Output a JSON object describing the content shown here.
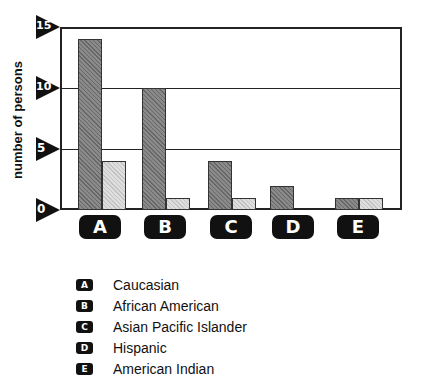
{
  "chart_data": {
    "type": "bar",
    "title": "",
    "xlabel": "",
    "ylabel": "number of persons",
    "ylim": [
      0,
      15
    ],
    "yticks": [
      0,
      5,
      10,
      15
    ],
    "grid": true,
    "categories": [
      "A",
      "B",
      "C",
      "D",
      "E"
    ],
    "category_legend": {
      "A": "Caucasian",
      "B": "African American",
      "C": "Asian Pacific Islander",
      "D": "Hispanic",
      "E": "American Indian"
    },
    "series": [
      {
        "name": "dark",
        "values": [
          14,
          10,
          4,
          2,
          1
        ]
      },
      {
        "name": "light",
        "values": [
          4,
          1,
          1,
          0,
          1
        ]
      }
    ]
  },
  "axis": {
    "ylabel": "number of persons",
    "ticks": [
      "0",
      "5",
      "10",
      "15"
    ]
  },
  "categories": [
    "A",
    "B",
    "C",
    "D",
    "E"
  ],
  "legend": [
    {
      "badge": "A",
      "label": "Caucasian"
    },
    {
      "badge": "B",
      "label": "African American"
    },
    {
      "badge": "C",
      "label": "Asian Pacific Islander"
    },
    {
      "badge": "D",
      "label": "Hispanic"
    },
    {
      "badge": "E",
      "label": "American Indian"
    }
  ]
}
